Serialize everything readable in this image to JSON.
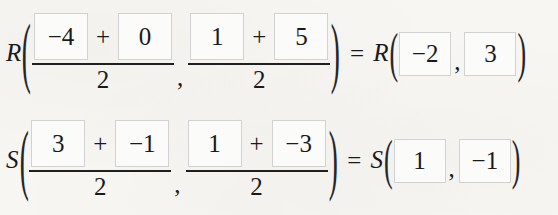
{
  "document": {
    "title": "Midpoint formula worked rows",
    "background_color": "#f7f6f3",
    "box_border_color": "#d2d2d2",
    "text_color": "#1a1a1a"
  },
  "symbols": {
    "plus": "+",
    "equals": "=",
    "comma": ",",
    "paren_open": "(",
    "paren_close": ")"
  },
  "rows": [
    {
      "id": "R",
      "label": "R",
      "x_fraction": {
        "term1": "−4",
        "term2": "0",
        "denominator": "2"
      },
      "y_fraction": {
        "term1": "1",
        "term2": "5",
        "denominator": "2"
      },
      "result": {
        "label": "R",
        "x": "−2",
        "y": "3"
      }
    },
    {
      "id": "S",
      "label": "S",
      "x_fraction": {
        "term1": "3",
        "term2": "−1",
        "denominator": "2"
      },
      "y_fraction": {
        "term1": "1",
        "term2": "−3",
        "denominator": "2"
      },
      "result": {
        "label": "S",
        "x": "1",
        "y": "−1"
      }
    }
  ]
}
